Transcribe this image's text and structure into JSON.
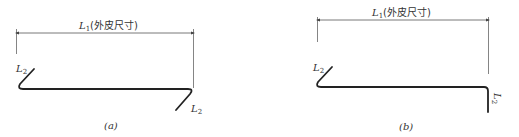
{
  "figures": [
    {
      "id": "a",
      "caption": "(a)",
      "dimension_label_var": "L",
      "dimension_label_sub": "1",
      "dimension_label_text": "(外皮尺寸)",
      "hook_label_left": "L",
      "hook_label_left_sub": "2",
      "hook_label_right": "L",
      "hook_label_right_sub": "2",
      "description": "Bar with 135° hooks at both ends, opposite directions"
    },
    {
      "id": "b",
      "caption": "(b)",
      "dimension_label_var": "L",
      "dimension_label_sub": "1",
      "dimension_label_text": "(外皮尺寸)",
      "hook_label_left": "L",
      "hook_label_left_sub": "2",
      "hook_label_right": "L",
      "hook_label_right_sub": "2",
      "description": "Bar with 135° hook at left end and 90° bend at right end"
    }
  ],
  "colors": {
    "bar": "#222222",
    "dimension": "#555555",
    "text": "#333333"
  }
}
